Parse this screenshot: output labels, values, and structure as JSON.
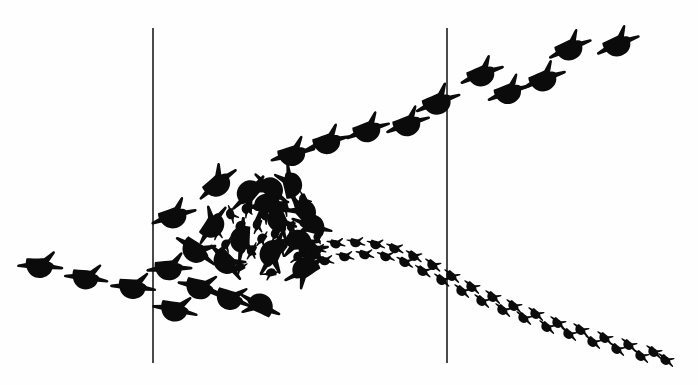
{
  "figure": {
    "background_color": "#fefefe",
    "ink_color": "#0b0b0b",
    "width": 698,
    "height": 385
  },
  "reference_lines": {
    "name": "vertical-reference-lines",
    "color": "#4a4a4a",
    "stroke_width": 1.15,
    "items": [
      {
        "label": "left-reference-line",
        "x": 153,
        "y1": 28,
        "y2": 363
      },
      {
        "label": "right-reference-line",
        "x": 447,
        "y1": 28,
        "y2": 363
      }
    ]
  },
  "chart_data": {
    "type": "scatter",
    "xlabel": "",
    "ylabel": "",
    "xlim": [
      0,
      698
    ],
    "ylim": [
      0,
      385
    ],
    "grid": false,
    "legend": null,
    "annotations": [
      "Two vertical reference lines at x = 153 and x = 447",
      "Approach trail of large three-toed tracks enters from lower left",
      "Dense milling cluster of large and small tracks near centre-left",
      "Departure trail of large tracks ascends to upper right",
      "Departure trail of small paired tracks descends to lower right"
    ],
    "series": [
      {
        "name": "approach-trail-large",
        "marker": "bird-foot-large",
        "track_size": "large",
        "points": [
          {
            "x": 43,
            "y": 265,
            "rot": -18,
            "scale": 1.0
          },
          {
            "x": 89,
            "y": 277,
            "rot": -14,
            "scale": 0.97
          },
          {
            "x": 136,
            "y": 286,
            "rot": -16,
            "scale": 1.0
          },
          {
            "x": 178,
            "y": 309,
            "rot": -10,
            "scale": 1.0
          }
        ]
      },
      {
        "name": "milling-cluster-large",
        "marker": "bird-foot-large",
        "track_size": "large",
        "points": [
          {
            "x": 176,
            "y": 214,
            "rot": -38,
            "scale": 1.02
          },
          {
            "x": 172,
            "y": 267,
            "rot": -24,
            "scale": 1.0
          },
          {
            "x": 199,
            "y": 251,
            "rot": 14,
            "scale": 1.03
          },
          {
            "x": 203,
            "y": 287,
            "rot": -6,
            "scale": 1.0
          },
          {
            "x": 219,
            "y": 181,
            "rot": -60,
            "scale": 1.02
          },
          {
            "x": 213,
            "y": 222,
            "rot": -76,
            "scale": 0.98
          },
          {
            "x": 229,
            "y": 263,
            "rot": 28,
            "scale": 1.0
          },
          {
            "x": 233,
            "y": 298,
            "rot": -2,
            "scale": 0.98
          },
          {
            "x": 248,
            "y": 196,
            "rot": 112,
            "scale": 1.0
          },
          {
            "x": 243,
            "y": 243,
            "rot": 74,
            "scale": 1.0
          },
          {
            "x": 257,
            "y": 305,
            "rot": 186,
            "scale": 0.97
          },
          {
            "x": 264,
            "y": 207,
            "rot": 152,
            "scale": 1.0
          },
          {
            "x": 268,
            "y": 188,
            "rot": 200,
            "scale": 0.95
          },
          {
            "x": 272,
            "y": 257,
            "rot": 96,
            "scale": 1.05
          },
          {
            "x": 281,
            "y": 222,
            "rot": 48,
            "scale": 0.96
          },
          {
            "x": 289,
            "y": 182,
            "rot": 238,
            "scale": 0.95
          },
          {
            "x": 295,
            "y": 243,
            "rot": 160,
            "scale": 1.0
          },
          {
            "x": 301,
            "y": 210,
            "rot": 210,
            "scale": 0.98
          },
          {
            "x": 303,
            "y": 272,
            "rot": 128,
            "scale": 1.0
          },
          {
            "x": 309,
            "y": 226,
            "rot": 176,
            "scale": 0.93
          },
          {
            "x": 313,
            "y": 250,
            "rot": 20,
            "scale": 0.92
          }
        ]
      },
      {
        "name": "milling-cluster-small",
        "marker": "bird-foot-small",
        "track_size": "small",
        "points": [
          {
            "x": 218,
            "y": 232,
            "rot": 84,
            "scale": 1.0
          },
          {
            "x": 226,
            "y": 246,
            "rot": 100,
            "scale": 0.95
          },
          {
            "x": 232,
            "y": 215,
            "rot": 52,
            "scale": 1.0
          },
          {
            "x": 239,
            "y": 269,
            "rot": 130,
            "scale": 0.95
          },
          {
            "x": 241,
            "y": 228,
            "rot": 90,
            "scale": 1.05
          },
          {
            "x": 247,
            "y": 210,
            "rot": 70,
            "scale": 0.95
          },
          {
            "x": 252,
            "y": 252,
            "rot": 96,
            "scale": 1.0
          },
          {
            "x": 258,
            "y": 226,
            "rot": 88,
            "scale": 1.0
          },
          {
            "x": 262,
            "y": 240,
            "rot": 104,
            "scale": 0.95
          },
          {
            "x": 266,
            "y": 216,
            "rot": 60,
            "scale": 1.0
          },
          {
            "x": 270,
            "y": 274,
            "rot": 148,
            "scale": 0.95
          },
          {
            "x": 276,
            "y": 235,
            "rot": 92,
            "scale": 1.0
          },
          {
            "x": 282,
            "y": 250,
            "rot": 108,
            "scale": 0.95
          },
          {
            "x": 286,
            "y": 208,
            "rot": 56,
            "scale": 1.0
          },
          {
            "x": 292,
            "y": 228,
            "rot": 84,
            "scale": 0.95
          },
          {
            "x": 298,
            "y": 258,
            "rot": 120,
            "scale": 1.0
          },
          {
            "x": 305,
            "y": 200,
            "rot": 44,
            "scale": 0.95
          },
          {
            "x": 312,
            "y": 214,
            "rot": 72,
            "scale": 1.0
          },
          {
            "x": 318,
            "y": 238,
            "rot": 100,
            "scale": 0.9
          }
        ]
      },
      {
        "name": "departure-trail-large-upper-right",
        "marker": "bird-foot-large",
        "track_size": "large",
        "points": [
          {
            "x": 295,
            "y": 152,
            "rot": -36,
            "scale": 1.0
          },
          {
            "x": 330,
            "y": 140,
            "rot": -38,
            "scale": 1.0
          },
          {
            "x": 370,
            "y": 128,
            "rot": -40,
            "scale": 1.0
          },
          {
            "x": 410,
            "y": 122,
            "rot": -40,
            "scale": 1.0
          },
          {
            "x": 440,
            "y": 100,
            "rot": -42,
            "scale": 1.03
          },
          {
            "x": 484,
            "y": 72,
            "rot": -42,
            "scale": 1.0
          },
          {
            "x": 511,
            "y": 90,
            "rot": -40,
            "scale": 0.98
          },
          {
            "x": 546,
            "y": 77,
            "rot": -42,
            "scale": 1.0
          },
          {
            "x": 572,
            "y": 46,
            "rot": -44,
            "scale": 1.0
          },
          {
            "x": 620,
            "y": 42,
            "rot": -44,
            "scale": 1.0
          }
        ]
      },
      {
        "name": "departure-trail-small-lower-right",
        "marker": "bird-foot-small",
        "track_size": "small",
        "points": [
          {
            "x": 318,
            "y": 249,
            "rot": -8,
            "scale": 1.0
          },
          {
            "x": 326,
            "y": 260,
            "rot": -6,
            "scale": 1.0
          },
          {
            "x": 337,
            "y": 243,
            "rot": -8,
            "scale": 1.0
          },
          {
            "x": 346,
            "y": 256,
            "rot": -6,
            "scale": 1.0
          },
          {
            "x": 357,
            "y": 242,
            "rot": -6,
            "scale": 1.0
          },
          {
            "x": 366,
            "y": 254,
            "rot": -4,
            "scale": 1.0
          },
          {
            "x": 377,
            "y": 244,
            "rot": -2,
            "scale": 1.0
          },
          {
            "x": 387,
            "y": 256,
            "rot": 2,
            "scale": 1.0
          },
          {
            "x": 396,
            "y": 248,
            "rot": 6,
            "scale": 1.0
          },
          {
            "x": 406,
            "y": 262,
            "rot": 10,
            "scale": 1.0
          },
          {
            "x": 415,
            "y": 256,
            "rot": 14,
            "scale": 1.0
          },
          {
            "x": 424,
            "y": 271,
            "rot": 16,
            "scale": 1.0
          },
          {
            "x": 434,
            "y": 265,
            "rot": 18,
            "scale": 1.0
          },
          {
            "x": 443,
            "y": 280,
            "rot": 18,
            "scale": 1.0
          },
          {
            "x": 453,
            "y": 276,
            "rot": 20,
            "scale": 1.0
          },
          {
            "x": 463,
            "y": 291,
            "rot": 20,
            "scale": 1.0
          },
          {
            "x": 473,
            "y": 287,
            "rot": 20,
            "scale": 1.0
          },
          {
            "x": 483,
            "y": 301,
            "rot": 20,
            "scale": 1.0
          },
          {
            "x": 494,
            "y": 297,
            "rot": 20,
            "scale": 1.0
          },
          {
            "x": 504,
            "y": 310,
            "rot": 20,
            "scale": 1.0
          },
          {
            "x": 515,
            "y": 306,
            "rot": 20,
            "scale": 1.0
          },
          {
            "x": 525,
            "y": 318,
            "rot": 20,
            "scale": 1.0
          },
          {
            "x": 537,
            "y": 314,
            "rot": 20,
            "scale": 1.0
          },
          {
            "x": 548,
            "y": 327,
            "rot": 20,
            "scale": 1.0
          },
          {
            "x": 559,
            "y": 323,
            "rot": 20,
            "scale": 1.0
          },
          {
            "x": 570,
            "y": 334,
            "rot": 20,
            "scale": 1.0
          },
          {
            "x": 582,
            "y": 330,
            "rot": 20,
            "scale": 1.0
          },
          {
            "x": 594,
            "y": 342,
            "rot": 20,
            "scale": 1.0
          },
          {
            "x": 606,
            "y": 338,
            "rot": 20,
            "scale": 1.0
          },
          {
            "x": 618,
            "y": 349,
            "rot": 20,
            "scale": 1.0
          },
          {
            "x": 630,
            "y": 345,
            "rot": 20,
            "scale": 1.0
          },
          {
            "x": 642,
            "y": 356,
            "rot": 20,
            "scale": 1.0
          },
          {
            "x": 655,
            "y": 352,
            "rot": 20,
            "scale": 1.0
          },
          {
            "x": 667,
            "y": 360,
            "rot": 20,
            "scale": 1.0
          }
        ]
      }
    ]
  }
}
